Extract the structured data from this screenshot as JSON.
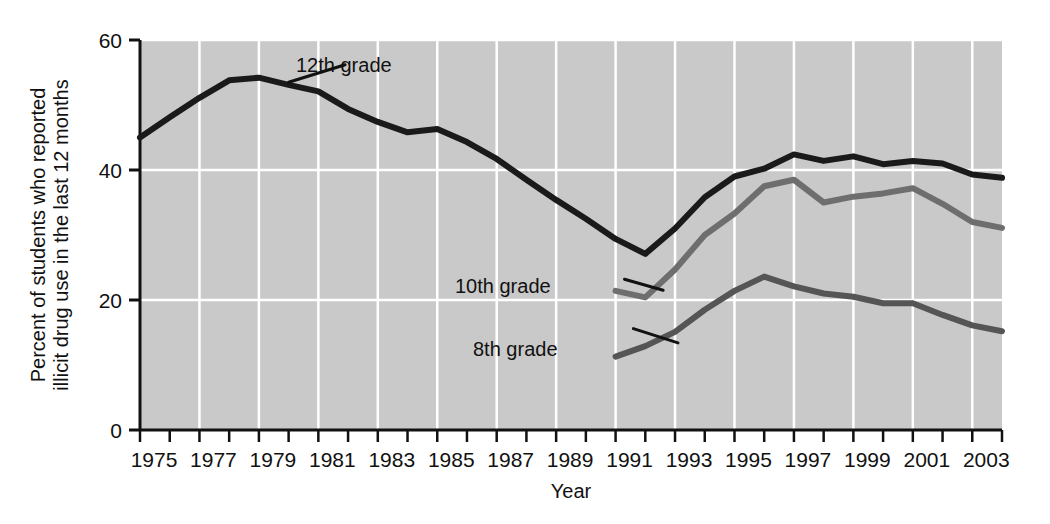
{
  "chart_data": {
    "type": "line",
    "title": "",
    "subtitle": "",
    "xlabel": "Year",
    "ylabel": "Percent of students who reported illicit drug use in the last 12 months",
    "ylabel_line1": "Percent of students who reported",
    "ylabel_line2": "illicit drug use in the last 12 months",
    "xlim": [
      1975,
      2004
    ],
    "ylim": [
      0,
      60
    ],
    "yticks": [
      0,
      20,
      40,
      60
    ],
    "ytick_labels": [
      "0",
      "20",
      "40",
      "60"
    ],
    "xticks": [
      1975,
      1976,
      1977,
      1978,
      1979,
      1980,
      1981,
      1982,
      1983,
      1984,
      1985,
      1986,
      1987,
      1988,
      1989,
      1990,
      1991,
      1992,
      1993,
      1994,
      1995,
      1996,
      1997,
      1998,
      1999,
      2000,
      2001,
      2002,
      2003,
      2004
    ],
    "xtick_labels": [
      "1975",
      "1977",
      "1979",
      "1981",
      "1983",
      "1985",
      "1987",
      "1989",
      "1991",
      "1993",
      "1995",
      "1997",
      "1999",
      "2001",
      "2003"
    ],
    "xtick_label_years": [
      1975,
      1977,
      1979,
      1981,
      1983,
      1985,
      1987,
      1989,
      1991,
      1993,
      1995,
      1997,
      1999,
      2001,
      2003
    ],
    "grid": true,
    "grid_color": "#ffffff",
    "plot_background": "#c9c9c9",
    "legend_position": "inline-annotation",
    "series": [
      {
        "name": "12th grade",
        "color": "#1a1a1a",
        "label_x": 1982.1,
        "label_y": 57.0,
        "x": [
          1975,
          1976,
          1977,
          1978,
          1979,
          1980,
          1981,
          1982,
          1983,
          1984,
          1985,
          1986,
          1987,
          1988,
          1989,
          1990,
          1991,
          1992,
          1993,
          1994,
          1995,
          1996,
          1997,
          1998,
          1999,
          2000,
          2001,
          2002,
          2003,
          2004
        ],
        "values": [
          45.0,
          48.1,
          51.1,
          53.8,
          54.2,
          53.1,
          52.1,
          49.4,
          47.4,
          45.8,
          46.3,
          44.3,
          41.7,
          38.5,
          35.4,
          32.5,
          29.4,
          27.1,
          31.0,
          35.8,
          39.0,
          40.2,
          42.4,
          41.4,
          42.1,
          40.9,
          41.4,
          41.0,
          39.3,
          38.8
        ]
      },
      {
        "name": "10th grade",
        "color": "#6e6e6e",
        "label_x": 1988.5,
        "label_y": 23.6,
        "x": [
          1991,
          1992,
          1993,
          1994,
          1995,
          1996,
          1997,
          1998,
          1999,
          2000,
          2001,
          2002,
          2003,
          2004
        ],
        "values": [
          21.4,
          20.4,
          24.7,
          30.0,
          33.3,
          37.5,
          38.5,
          35.0,
          35.9,
          36.4,
          37.2,
          34.8,
          32.0,
          31.1
        ]
      },
      {
        "name": "8th grade",
        "color": "#555555",
        "label_x": 1989.2,
        "label_y": 16.0,
        "x": [
          1991,
          1992,
          1993,
          1994,
          1995,
          1996,
          1997,
          1998,
          1999,
          2000,
          2001,
          2002,
          2003,
          2004
        ],
        "values": [
          11.3,
          12.9,
          15.1,
          18.5,
          21.4,
          23.6,
          22.1,
          21.0,
          20.5,
          19.5,
          19.5,
          17.7,
          16.1,
          15.2
        ]
      }
    ],
    "annotations": [
      {
        "text": "12th grade",
        "leader_from": [
          1981.9,
          56.2
        ],
        "leader_to": [
          1980.0,
          53.5
        ]
      },
      {
        "text": "10th grade",
        "leader_from": [
          1991.3,
          23.2
        ],
        "leader_to": [
          1992.6,
          21.5
        ]
      },
      {
        "text": "8th grade",
        "leader_from": [
          1991.6,
          15.6
        ],
        "leader_to": [
          1993.1,
          13.4
        ]
      }
    ]
  }
}
